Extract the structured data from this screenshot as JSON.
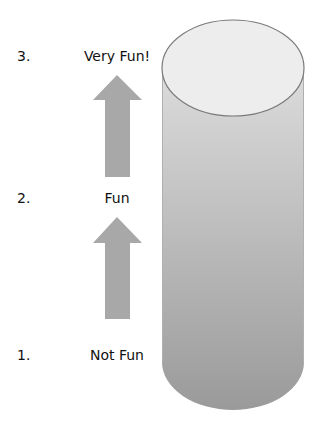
{
  "scale": {
    "levels": [
      {
        "number": "3.",
        "label": "Very Fun!"
      },
      {
        "number": "2.",
        "label": "Fun"
      },
      {
        "number": "1.",
        "label": "Not Fun"
      }
    ]
  },
  "colors": {
    "arrow": "#a8a8a8",
    "cylinder_top": "#ededed",
    "cylinder_body_top": "#dadada",
    "cylinder_body_bottom": "#9c9c9c",
    "outline": "#7a7a7a"
  }
}
